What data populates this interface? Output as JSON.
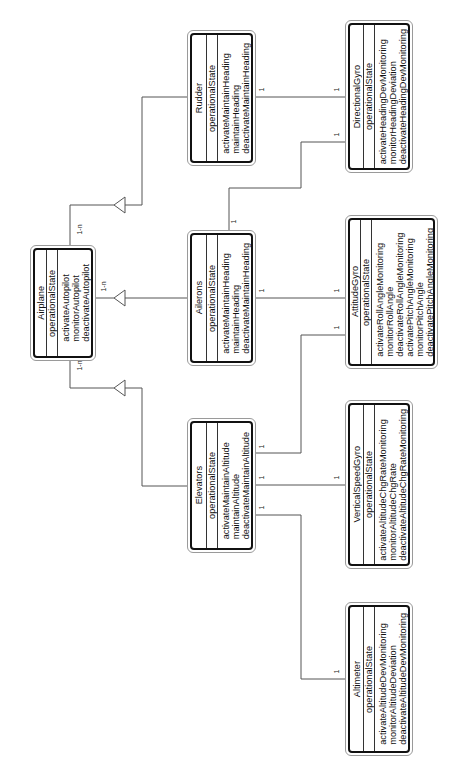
{
  "diagram": {
    "type": "UML class diagram (rotated 90° counter-clockwise)",
    "classes": {
      "airplane": {
        "name": "Airplane",
        "attributes": [
          "operationalState"
        ],
        "operations": [
          "activateAutopilot",
          "monitorAutopilot",
          "deactivateAutopilot"
        ]
      },
      "rudder": {
        "name": "Rudder",
        "attributes": [
          "operationalState"
        ],
        "operations": [
          "activateMaintainHeading",
          "maintainHeading",
          "deactivateMaintainHeading"
        ]
      },
      "ailerons": {
        "name": "Ailerons",
        "attributes": [
          "operationalState"
        ],
        "operations": [
          "activateMaintainHeading",
          "maintainHeading",
          "deactivateMaintainHeading"
        ]
      },
      "elevators": {
        "name": "Elevators",
        "attributes": [
          "operationalState"
        ],
        "operations": [
          "activateMaintainAltitude",
          "maintainAltitude",
          "deactivateMaintainAltitude"
        ]
      },
      "directional_gyro": {
        "name": "DirectionalGyro",
        "attributes": [
          "operationalState"
        ],
        "operations": [
          "activateHeadingDevMonitoring",
          "monitorHeadingDeviation",
          "deactivateHeadingDevMonitoring"
        ]
      },
      "attitude_gyro": {
        "name": "AttitudeGyro",
        "attributes": [
          "operationalState"
        ],
        "operations": [
          "activateRollAngleMonitoring",
          "monitorRollAngle",
          "deactivateRollAngleMonitoring",
          "activatePitchAngleMonitoring",
          "monitorPitchAngle",
          "deactivatePitchAngleMonitoring"
        ]
      },
      "vertical_speed_gyro": {
        "name": "VerticalSpeedGyro",
        "attributes": [
          "operationalState"
        ],
        "operations": [
          "activateAltitudeChgRateMonitoring",
          "monitorAltitudeChgRate",
          "deactivateAltitudeChgRateMonitoring"
        ]
      },
      "altimeter": {
        "name": "Altimeter",
        "attributes": [
          "operationalState"
        ],
        "operations": [
          "activateAltitudeDevMonitoring",
          "monitorAltitudeDeviation",
          "deactivateAltitudeDevMonitoring"
        ]
      }
    },
    "multiplicities": {
      "airplane_rudder": "1-n",
      "airplane_ailerons": "1-n",
      "airplane_elevators": "1-n",
      "one": "1"
    },
    "relationships": [
      {
        "from": "Airplane",
        "to": "Rudder",
        "kind": "aggregation-arrow",
        "multiplicity": "1-n"
      },
      {
        "from": "Airplane",
        "to": "Ailerons",
        "kind": "aggregation-arrow",
        "multiplicity": "1-n"
      },
      {
        "from": "Airplane",
        "to": "Elevators",
        "kind": "aggregation-arrow",
        "multiplicity": "1-n"
      },
      {
        "from": "Rudder",
        "to": "DirectionalGyro",
        "multiplicity": [
          "1",
          "1"
        ]
      },
      {
        "from": "Ailerons",
        "to": "DirectionalGyro",
        "multiplicity": [
          "1",
          "1"
        ]
      },
      {
        "from": "Ailerons",
        "to": "AttitudeGyro",
        "multiplicity": [
          "1",
          "1"
        ]
      },
      {
        "from": "Elevators",
        "to": "AttitudeGyro",
        "multiplicity": [
          "1",
          "1"
        ]
      },
      {
        "from": "Elevators",
        "to": "VerticalSpeedGyro",
        "multiplicity": [
          "1",
          "1"
        ]
      },
      {
        "from": "Elevators",
        "to": "Altimeter",
        "multiplicity": [
          "1",
          "1"
        ]
      }
    ],
    "colors": {
      "line": "#555555",
      "box_border": "#111111",
      "background": "#ffffff"
    }
  }
}
